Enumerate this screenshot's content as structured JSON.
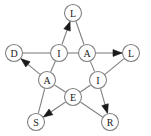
{
  "diagram": {
    "type": "directed-graph",
    "width": 151,
    "height": 136,
    "colors": {
      "background": "#ffffff",
      "node_stroke": "#808080",
      "node_fill": "#ffffff",
      "label": "#1a1a1a",
      "edge": "#808080",
      "arrow": "#1a1a1a"
    },
    "nodes": [
      {
        "id": "n0",
        "label": "L",
        "x": 73,
        "y": 13,
        "r": 8.5,
        "role": "outer-top"
      },
      {
        "id": "n1",
        "label": "D",
        "x": 14,
        "y": 53,
        "r": 8.5,
        "role": "outer-left"
      },
      {
        "id": "n2",
        "label": "L",
        "x": 131,
        "y": 53,
        "r": 8.5,
        "role": "outer-right"
      },
      {
        "id": "n3",
        "label": "S",
        "x": 36,
        "y": 122,
        "r": 8.5,
        "role": "outer-bottom-left"
      },
      {
        "id": "n4",
        "label": "R",
        "x": 110,
        "y": 122,
        "r": 8.5,
        "role": "outer-bottom-right"
      },
      {
        "id": "n5",
        "label": "I",
        "x": 59,
        "y": 53,
        "r": 8.5,
        "role": "inner-top-left"
      },
      {
        "id": "n6",
        "label": "A",
        "x": 87,
        "y": 53,
        "r": 8.5,
        "role": "inner-top-right"
      },
      {
        "id": "n7",
        "label": "A",
        "x": 47,
        "y": 80,
        "r": 8.5,
        "role": "inner-left"
      },
      {
        "id": "n8",
        "label": "I",
        "x": 98,
        "y": 80,
        "r": 8.5,
        "role": "inner-right"
      },
      {
        "id": "n9",
        "label": "E",
        "x": 73,
        "y": 97,
        "r": 8.5,
        "role": "inner-bottom"
      }
    ],
    "edges": [
      {
        "from": "n5",
        "to": "n0",
        "directed": true,
        "name": "edge-I-to-L-top"
      },
      {
        "from": "n6",
        "to": "n0",
        "directed": false,
        "name": "edge-A-to-L-top"
      },
      {
        "from": "n1",
        "to": "n5",
        "directed": false,
        "name": "edge-D-to-I"
      },
      {
        "from": "n5",
        "to": "n6",
        "directed": false,
        "name": "edge-I-to-A"
      },
      {
        "from": "n6",
        "to": "n2",
        "directed": true,
        "name": "edge-A-to-L-right"
      },
      {
        "from": "n7",
        "to": "n1",
        "directed": true,
        "name": "edge-A-to-D"
      },
      {
        "from": "n5",
        "to": "n7",
        "directed": false,
        "name": "edge-I-to-A-left"
      },
      {
        "from": "n6",
        "to": "n8",
        "directed": false,
        "name": "edge-A-to-I-right"
      },
      {
        "from": "n8",
        "to": "n2",
        "directed": false,
        "name": "edge-I-to-L-right"
      },
      {
        "from": "n7",
        "to": "n9",
        "directed": false,
        "name": "edge-A-to-E"
      },
      {
        "from": "n9",
        "to": "n8",
        "directed": false,
        "name": "edge-E-to-I"
      },
      {
        "from": "n7",
        "to": "n3",
        "directed": false,
        "name": "edge-A-to-S"
      },
      {
        "from": "n9",
        "to": "n3",
        "directed": true,
        "name": "edge-E-to-S"
      },
      {
        "from": "n9",
        "to": "n4",
        "directed": false,
        "name": "edge-E-to-R"
      },
      {
        "from": "n8",
        "to": "n4",
        "directed": true,
        "name": "edge-I-to-R"
      }
    ]
  }
}
